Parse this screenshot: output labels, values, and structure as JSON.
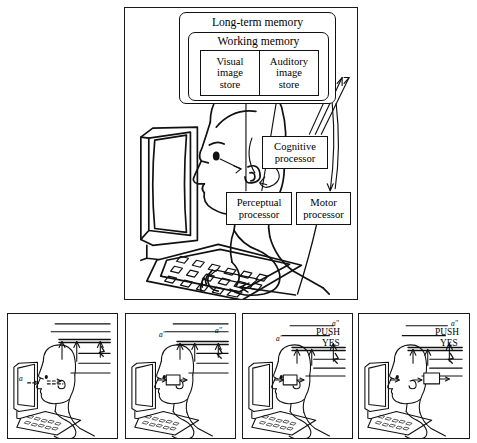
{
  "figure": {
    "title_present": false,
    "background_color": "#ffffff",
    "line_color": "#111111",
    "panel_count": 5
  },
  "main_panel": {
    "name": "model-human-processor-diagram",
    "long_term_memory": {
      "label": "Long-term memory"
    },
    "working_memory": {
      "label": "Working memory"
    },
    "stores": [
      {
        "id": "visual-image-store",
        "lines": [
          "Visual",
          "image",
          "store"
        ]
      },
      {
        "id": "auditory-image-store",
        "lines": [
          "Auditory",
          "image",
          "store"
        ]
      }
    ],
    "processors": [
      {
        "id": "cognitive-processor",
        "lines": [
          "Cognitive",
          "processor"
        ]
      },
      {
        "id": "perceptual-processor",
        "lines": [
          "Perceptual",
          "processor"
        ]
      },
      {
        "id": "motor-processor",
        "lines": [
          "Motor",
          "processor"
        ]
      }
    ]
  },
  "sequence_panels": [
    {
      "index": 1,
      "name": "sequence-panel-1",
      "labels_top": [],
      "labels_inline": [
        {
          "text": "a",
          "italic": true
        }
      ]
    },
    {
      "index": 2,
      "name": "sequence-panel-2",
      "labels_top": [
        {
          "text": "a'",
          "italic": true
        },
        {
          "text": "a''",
          "italic": true
        }
      ],
      "labels_inline": []
    },
    {
      "index": 3,
      "name": "sequence-panel-3",
      "labels_top": [
        {
          "text": "a'",
          "italic": true
        },
        {
          "text": "a''",
          "italic": true
        },
        {
          "text": "PUSH",
          "italic": false
        },
        {
          "text": "YES",
          "italic": false
        }
      ],
      "labels_inline": []
    },
    {
      "index": 4,
      "name": "sequence-panel-4",
      "labels_top": [
        {
          "text": "a''",
          "italic": true
        },
        {
          "text": "PUSH",
          "italic": false
        },
        {
          "text": "YES",
          "italic": false
        }
      ],
      "labels_inline": []
    }
  ]
}
